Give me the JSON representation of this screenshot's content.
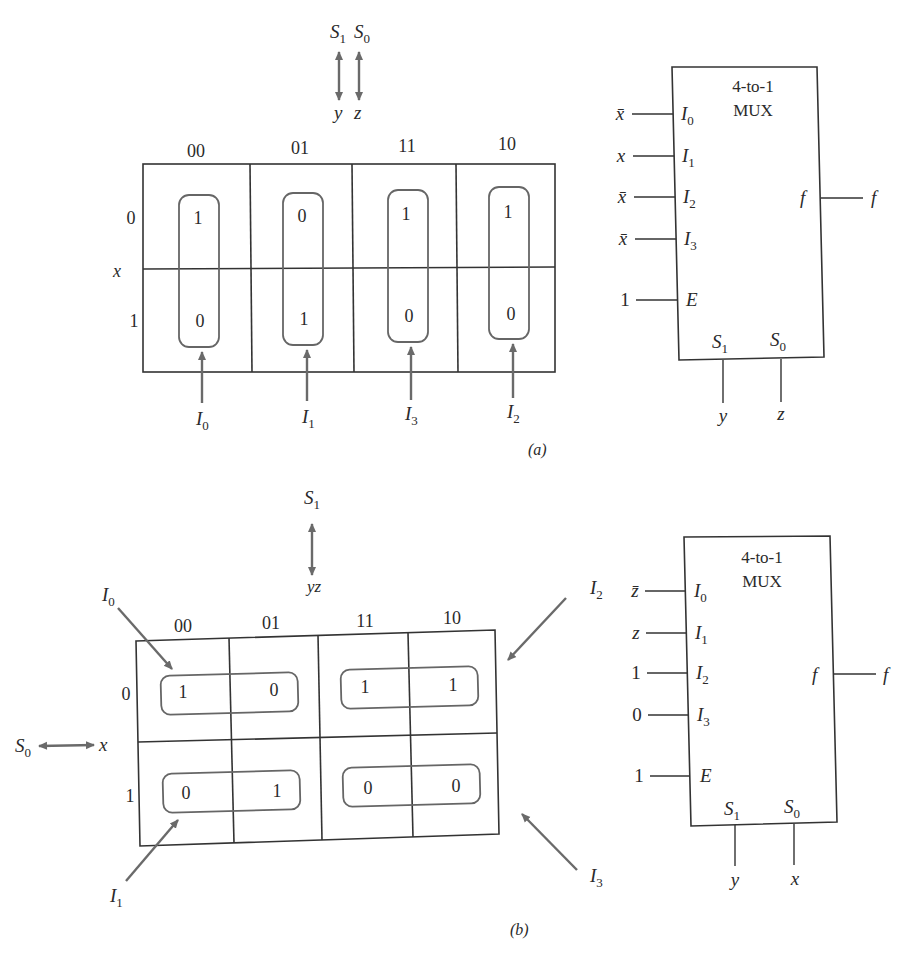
{
  "part_a": {
    "caption": "(a)",
    "select_header": {
      "s1": "S",
      "s1_sub": "1",
      "s0": "S",
      "s0_sub": "0",
      "var1": "y",
      "var2": "z"
    },
    "column_headers": [
      "00",
      "01",
      "11",
      "10"
    ],
    "row_headers": [
      "0",
      "1"
    ],
    "row_variable": "x",
    "cells": [
      [
        "1",
        "0",
        "1",
        "1"
      ],
      [
        "0",
        "1",
        "0",
        "0"
      ]
    ],
    "loop_labels": [
      {
        "base": "I",
        "sub": "0"
      },
      {
        "base": "I",
        "sub": "1"
      },
      {
        "base": "I",
        "sub": "3"
      },
      {
        "base": "I",
        "sub": "2"
      }
    ],
    "mux": {
      "title_line1": "4-to-1",
      "title_line2": "MUX",
      "inputs": [
        {
          "signal": "x̄",
          "pin": "I",
          "pin_sub": "0"
        },
        {
          "signal": "x",
          "pin": "I",
          "pin_sub": "1"
        },
        {
          "signal": "x̄",
          "pin": "I",
          "pin_sub": "2"
        },
        {
          "signal": "x̄",
          "pin": "I",
          "pin_sub": "3"
        }
      ],
      "enable": {
        "signal": "1",
        "pin": "E"
      },
      "output": {
        "pin": "f",
        "signal": "f"
      },
      "selects": [
        {
          "pin": "S",
          "pin_sub": "1",
          "signal": "y"
        },
        {
          "pin": "S",
          "pin_sub": "0",
          "signal": "z"
        }
      ]
    }
  },
  "part_b": {
    "caption": "(b)",
    "select_header": {
      "s1": "S",
      "s1_sub": "1",
      "var": "yz"
    },
    "row_select": {
      "s0": "S",
      "s0_sub": "0",
      "var": "x"
    },
    "column_headers": [
      "00",
      "01",
      "11",
      "10"
    ],
    "row_headers": [
      "0",
      "1"
    ],
    "cells": [
      [
        "1",
        "0",
        "1",
        "1"
      ],
      [
        "0",
        "1",
        "0",
        "0"
      ]
    ],
    "loop_labels": [
      {
        "base": "I",
        "sub": "0"
      },
      {
        "base": "I",
        "sub": "2"
      },
      {
        "base": "I",
        "sub": "1"
      },
      {
        "base": "I",
        "sub": "3"
      }
    ],
    "mux": {
      "title_line1": "4-to-1",
      "title_line2": "MUX",
      "inputs": [
        {
          "signal": "z̄",
          "pin": "I",
          "pin_sub": "0"
        },
        {
          "signal": "z",
          "pin": "I",
          "pin_sub": "1"
        },
        {
          "signal": "1",
          "pin": "I",
          "pin_sub": "2"
        },
        {
          "signal": "0",
          "pin": "I",
          "pin_sub": "3"
        }
      ],
      "enable": {
        "signal": "1",
        "pin": "E"
      },
      "output": {
        "pin": "f",
        "signal": "f"
      },
      "selects": [
        {
          "pin": "S",
          "pin_sub": "1",
          "signal": "y"
        },
        {
          "pin": "S",
          "pin_sub": "0",
          "signal": "x"
        }
      ]
    }
  }
}
